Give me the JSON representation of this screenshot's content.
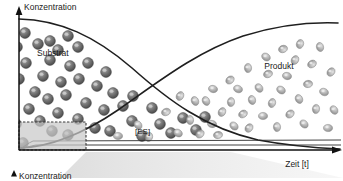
{
  "figure": {
    "title_axis_y": "Konzentration",
    "title_axis_x": "Zeit [t]",
    "label_substrate": "Substrat",
    "label_product": "Produkt",
    "label_es": "[ES]",
    "label_bottom_axis_y": "Konzentration",
    "colors": {
      "axis": "#111111",
      "curve": "#1f1f1f",
      "substrate_particle": "#6e6e6e",
      "substrate_particle_dark": "#4a4a4a",
      "substrate_highlight": "#b4b4b4",
      "product_particle": "#b0b0b0",
      "product_particle_dark": "#8e8e8e",
      "product_highlight": "#d8d8d8",
      "inset_box_fill": "#c9c9c9",
      "inset_box_stroke": "#3a3a3a",
      "funnel_fill": "#e8e8e8",
      "es_line": "#2a2a2a"
    }
  },
  "chart_data": {
    "type": "line",
    "title": "",
    "xlabel": "Zeit [t]",
    "ylabel": "Konzentration",
    "xlim": [
      0,
      100
    ],
    "ylim": [
      0,
      100
    ],
    "grid": false,
    "legend_position": "in-plot-annotations",
    "annotations": [
      {
        "text": "Substrat",
        "x": 12,
        "y": 72
      },
      {
        "text": "Produkt",
        "x": 83,
        "y": 62
      },
      {
        "text": "[ES]",
        "x": 41,
        "y": 12
      }
    ],
    "series": [
      {
        "name": "Substrat",
        "description": "sigmoidal decay from high initial concentration to near zero",
        "x": [
          0,
          10,
          20,
          30,
          40,
          50,
          55,
          60,
          70,
          80,
          90,
          100
        ],
        "values": [
          97,
          95,
          90,
          81,
          68,
          54,
          47,
          40,
          25,
          14,
          7,
          3
        ]
      },
      {
        "name": "Produkt",
        "description": "sigmoidal rise from zero to near saturation",
        "x": [
          0,
          10,
          20,
          30,
          40,
          50,
          55,
          60,
          70,
          80,
          90,
          100
        ],
        "values": [
          2,
          6,
          13,
          23,
          35,
          48,
          54,
          60,
          72,
          82,
          88,
          91
        ]
      },
      {
        "name": "[ES]",
        "description": "enzyme-substrate complex, rapid rise then flat steady-state at very low concentration",
        "x": [
          0,
          2,
          5,
          10,
          20,
          40,
          60,
          80,
          100
        ],
        "values": [
          0,
          4,
          6,
          6,
          6,
          6,
          6,
          6,
          6
        ]
      }
    ],
    "particles": {
      "substrate": [
        {
          "x": 23,
          "y": 143
        },
        {
          "x": 52,
          "y": 131
        },
        {
          "x": 68,
          "y": 135
        },
        {
          "x": 16,
          "y": 124
        },
        {
          "x": 40,
          "y": 121
        },
        {
          "x": 29,
          "y": 109
        },
        {
          "x": 58,
          "y": 113
        },
        {
          "x": 78,
          "y": 119
        },
        {
          "x": 95,
          "y": 128
        },
        {
          "x": 13,
          "y": 96
        },
        {
          "x": 35,
          "y": 92
        },
        {
          "x": 48,
          "y": 99
        },
        {
          "x": 66,
          "y": 95
        },
        {
          "x": 86,
          "y": 103
        },
        {
          "x": 104,
          "y": 110
        },
        {
          "x": 19,
          "y": 79
        },
        {
          "x": 43,
          "y": 76
        },
        {
          "x": 61,
          "y": 82
        },
        {
          "x": 79,
          "y": 79
        },
        {
          "x": 97,
          "y": 86
        },
        {
          "x": 113,
          "y": 93
        },
        {
          "x": 26,
          "y": 63
        },
        {
          "x": 50,
          "y": 60
        },
        {
          "x": 70,
          "y": 66
        },
        {
          "x": 88,
          "y": 63
        },
        {
          "x": 106,
          "y": 72
        },
        {
          "x": 17,
          "y": 47
        },
        {
          "x": 38,
          "y": 44
        },
        {
          "x": 58,
          "y": 50
        },
        {
          "x": 78,
          "y": 47
        },
        {
          "x": 25,
          "y": 33
        },
        {
          "x": 50,
          "y": 41
        },
        {
          "x": 68,
          "y": 36
        },
        {
          "x": 123,
          "y": 106
        },
        {
          "x": 132,
          "y": 121
        },
        {
          "x": 110,
          "y": 131
        },
        {
          "x": 142,
          "y": 136
        },
        {
          "x": 160,
          "y": 124
        },
        {
          "x": 171,
          "y": 133
        },
        {
          "x": 152,
          "y": 108
        },
        {
          "x": 183,
          "y": 118
        },
        {
          "x": 196,
          "y": 130
        },
        {
          "x": 205,
          "y": 117
        },
        {
          "x": 133,
          "y": 96
        }
      ],
      "product": [
        {
          "x": 118,
          "y": 136
        },
        {
          "x": 138,
          "y": 125
        },
        {
          "x": 149,
          "y": 137
        },
        {
          "x": 166,
          "y": 112
        },
        {
          "x": 178,
          "y": 133
        },
        {
          "x": 190,
          "y": 120
        },
        {
          "x": 200,
          "y": 134
        },
        {
          "x": 212,
          "y": 124
        },
        {
          "x": 206,
          "y": 101
        },
        {
          "x": 222,
          "y": 112
        },
        {
          "x": 218,
          "y": 135
        },
        {
          "x": 234,
          "y": 126
        },
        {
          "x": 231,
          "y": 102
        },
        {
          "x": 243,
          "y": 114
        },
        {
          "x": 238,
          "y": 89
        },
        {
          "x": 252,
          "y": 100
        },
        {
          "x": 249,
          "y": 128
        },
        {
          "x": 263,
          "y": 116
        },
        {
          "x": 259,
          "y": 88
        },
        {
          "x": 272,
          "y": 103
        },
        {
          "x": 268,
          "y": 74
        },
        {
          "x": 281,
          "y": 90
        },
        {
          "x": 277,
          "y": 127
        },
        {
          "x": 290,
          "y": 114
        },
        {
          "x": 287,
          "y": 76
        },
        {
          "x": 299,
          "y": 99
        },
        {
          "x": 295,
          "y": 60
        },
        {
          "x": 308,
          "y": 84
        },
        {
          "x": 304,
          "y": 124
        },
        {
          "x": 316,
          "y": 109
        },
        {
          "x": 312,
          "y": 64
        },
        {
          "x": 324,
          "y": 92
        },
        {
          "x": 320,
          "y": 47
        },
        {
          "x": 331,
          "y": 72
        },
        {
          "x": 328,
          "y": 128
        },
        {
          "x": 334,
          "y": 110
        },
        {
          "x": 300,
          "y": 44
        },
        {
          "x": 283,
          "y": 49
        },
        {
          "x": 266,
          "y": 57
        },
        {
          "x": 248,
          "y": 68
        },
        {
          "x": 230,
          "y": 80
        },
        {
          "x": 213,
          "y": 89
        },
        {
          "x": 195,
          "y": 101
        },
        {
          "x": 180,
          "y": 96
        }
      ]
    }
  }
}
